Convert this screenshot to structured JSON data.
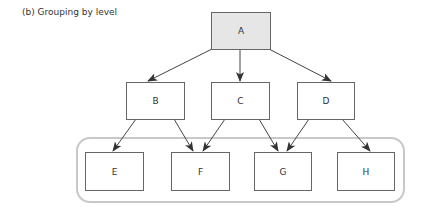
{
  "caption": "(b) Grouping by level",
  "colors": {
    "node_stroke": "#666666",
    "root_fill": "#e6e6e6",
    "node_fill": "#ffffff",
    "edge": "#444444",
    "group_stroke": "#c8c8c8"
  },
  "nodes": {
    "A": {
      "label": "A",
      "x": 211,
      "y": 12,
      "w": 59,
      "h": 37,
      "root": true
    },
    "B": {
      "label": "B",
      "x": 126,
      "y": 82,
      "w": 58,
      "h": 37
    },
    "C": {
      "label": "C",
      "x": 211,
      "y": 82,
      "w": 58,
      "h": 37
    },
    "D": {
      "label": "D",
      "x": 297,
      "y": 82,
      "w": 57,
      "h": 37
    },
    "E": {
      "label": "E",
      "x": 85,
      "y": 152,
      "w": 58,
      "h": 38
    },
    "F": {
      "label": "F",
      "x": 171,
      "y": 152,
      "w": 58,
      "h": 38
    },
    "G": {
      "label": "G",
      "x": 254,
      "y": 152,
      "w": 57,
      "h": 38
    },
    "H": {
      "label": "H",
      "x": 337,
      "y": 152,
      "w": 57,
      "h": 38
    }
  },
  "edges": [
    {
      "from": "A",
      "to": "B",
      "x1": 212,
      "y1": 49,
      "x2": 148,
      "y2": 81
    },
    {
      "from": "A",
      "to": "C",
      "x1": 240,
      "y1": 49,
      "x2": 240,
      "y2": 81
    },
    {
      "from": "A",
      "to": "D",
      "x1": 269,
      "y1": 49,
      "x2": 331,
      "y2": 81
    },
    {
      "from": "B",
      "to": "E",
      "x1": 136,
      "y1": 119,
      "x2": 113,
      "y2": 151
    },
    {
      "from": "B",
      "to": "F",
      "x1": 174,
      "y1": 119,
      "x2": 193,
      "y2": 151
    },
    {
      "from": "C",
      "to": "F",
      "x1": 225,
      "y1": 119,
      "x2": 203,
      "y2": 151
    },
    {
      "from": "C",
      "to": "G",
      "x1": 259,
      "y1": 119,
      "x2": 278,
      "y2": 151
    },
    {
      "from": "D",
      "to": "G",
      "x1": 309,
      "y1": 119,
      "x2": 287,
      "y2": 151
    },
    {
      "from": "D",
      "to": "H",
      "x1": 342,
      "y1": 119,
      "x2": 370,
      "y2": 151
    }
  ],
  "group": {
    "label": "level-2 group",
    "x": 77,
    "y": 138,
    "w": 327,
    "h": 64,
    "rx": 13,
    "members": [
      "E",
      "F",
      "G",
      "H"
    ]
  }
}
